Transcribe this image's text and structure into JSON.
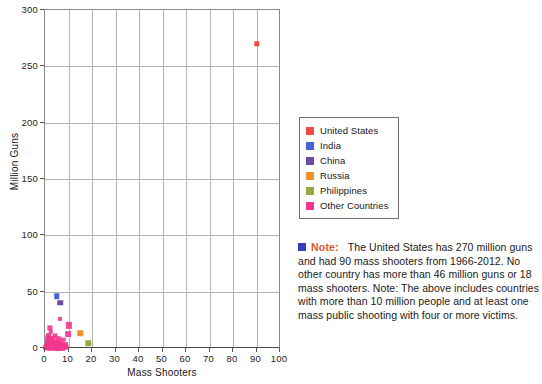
{
  "chart_data": {
    "type": "scatter",
    "title": "",
    "xlabel": "Mass Shooters",
    "ylabel": "Million Guns",
    "xlim": [
      0,
      100
    ],
    "ylim": [
      0,
      300
    ],
    "xticks": [
      0,
      10,
      20,
      30,
      40,
      50,
      60,
      70,
      80,
      90,
      100
    ],
    "yticks": [
      0,
      50,
      100,
      150,
      200,
      250,
      300
    ],
    "grid": true,
    "legend_position": "right",
    "series": [
      {
        "name": "United States",
        "color": "#f04b42",
        "points": [
          {
            "x": 90,
            "y": 270
          }
        ]
      },
      {
        "name": "India",
        "color": "#4a62d8",
        "points": [
          {
            "x": 5,
            "y": 46
          }
        ]
      },
      {
        "name": "China",
        "color": "#6e4aa8",
        "points": [
          {
            "x": 6.5,
            "y": 40
          }
        ]
      },
      {
        "name": "Russia",
        "color": "#f2912c",
        "points": [
          {
            "x": 15,
            "y": 13
          }
        ]
      },
      {
        "name": "Philippines",
        "color": "#97a83c",
        "points": [
          {
            "x": 18.5,
            "y": 4
          }
        ]
      },
      {
        "name": "Other Countries",
        "color": "#f2368c",
        "points": [
          {
            "x": 6.2,
            "y": 25.5
          },
          {
            "x": 10.3,
            "y": 20
          },
          {
            "x": 2.2,
            "y": 18
          },
          {
            "x": 2.4,
            "y": 14.5
          },
          {
            "x": 9.8,
            "y": 12
          },
          {
            "x": 1.5,
            "y": 11
          },
          {
            "x": 4.2,
            "y": 11
          },
          {
            "x": 1.2,
            "y": 9
          },
          {
            "x": 2.1,
            "y": 8.2
          },
          {
            "x": 3.2,
            "y": 8
          },
          {
            "x": 5.6,
            "y": 7.8
          },
          {
            "x": 7.8,
            "y": 7.2
          },
          {
            "x": 1.4,
            "y": 6
          },
          {
            "x": 2.6,
            "y": 5.5
          },
          {
            "x": 4.4,
            "y": 5.2
          },
          {
            "x": 1.1,
            "y": 4
          },
          {
            "x": 2.0,
            "y": 3.4
          },
          {
            "x": 3.0,
            "y": 3.0
          },
          {
            "x": 5.0,
            "y": 3.2
          },
          {
            "x": 6.6,
            "y": 3.4
          },
          {
            "x": 8.6,
            "y": 3.0
          },
          {
            "x": 1.0,
            "y": 2.0
          },
          {
            "x": 1.8,
            "y": 1.8
          },
          {
            "x": 2.8,
            "y": 1.6
          },
          {
            "x": 3.8,
            "y": 1.8
          },
          {
            "x": 4.8,
            "y": 1.4
          },
          {
            "x": 5.9,
            "y": 1.6
          },
          {
            "x": 7.2,
            "y": 1.5
          },
          {
            "x": 0.8,
            "y": 0.8
          },
          {
            "x": 1.6,
            "y": 0.7
          },
          {
            "x": 2.5,
            "y": 0.6
          },
          {
            "x": 3.4,
            "y": 0.8
          },
          {
            "x": 4.3,
            "y": 0.7
          },
          {
            "x": 5.3,
            "y": 0.6
          },
          {
            "x": 6.3,
            "y": 0.7
          },
          {
            "x": 8.0,
            "y": 0.6
          },
          {
            "x": 9.2,
            "y": 0.5
          },
          {
            "x": 0.5,
            "y": 0.2
          },
          {
            "x": 1.3,
            "y": 0.2
          },
          {
            "x": 2.2,
            "y": 0.2
          },
          {
            "x": 3.1,
            "y": 0.2
          },
          {
            "x": 4.0,
            "y": 0.2
          },
          {
            "x": 5.0,
            "y": 0.2
          },
          {
            "x": 6.0,
            "y": 0.2
          },
          {
            "x": 7.0,
            "y": 0.2
          }
        ]
      }
    ]
  },
  "axes": {
    "x_title": "Mass Shooters",
    "y_title": "Million Guns",
    "x_tick_labels": [
      "0",
      "10",
      "20",
      "30",
      "40",
      "50",
      "60",
      "70",
      "80",
      "90",
      "100"
    ],
    "y_tick_labels": [
      "0",
      "50",
      "100",
      "150",
      "200",
      "250",
      "300"
    ]
  },
  "legend": {
    "items": [
      {
        "label": "United States",
        "color": "#f04b42"
      },
      {
        "label": "India",
        "color": "#4a62d8"
      },
      {
        "label": "China",
        "color": "#6e4aa8"
      },
      {
        "label": "Russia",
        "color": "#f2912c"
      },
      {
        "label": "Philippines",
        "color": "#97a83c"
      },
      {
        "label": "Other Countries",
        "color": "#f2368c"
      }
    ]
  },
  "note": {
    "swatch_color": "#3b3bbe",
    "label": "Note:",
    "label_color": "#d8582a",
    "body": "The United States has 270 million guns and had 90 mass shooters from 1966-2012. No other country has more than 46 million guns or 18 mass shooters. Note: The above includes countries with more than 10 million people and at least one mass public shooting with four or more victims."
  }
}
